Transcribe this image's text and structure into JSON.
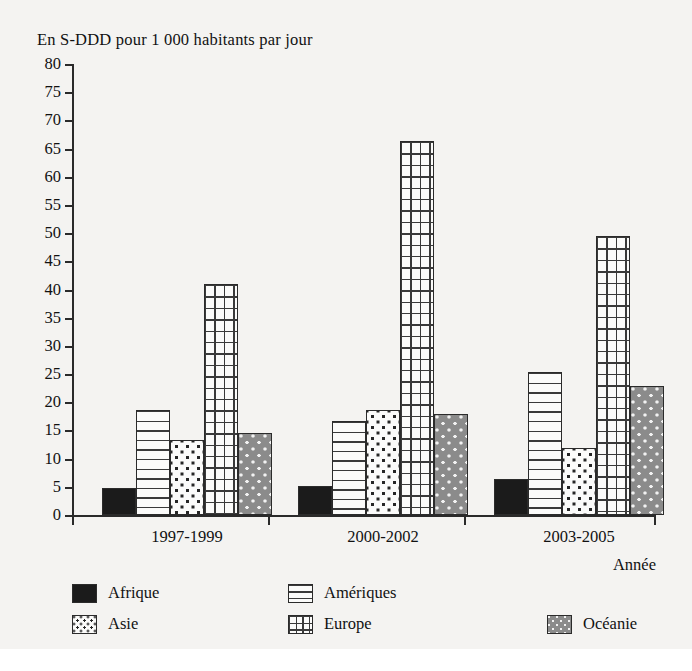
{
  "chart_data": {
    "type": "bar",
    "title": "",
    "ylabel": "En S-DDD pour 1 000 habitants par jour",
    "xlabel": "Année",
    "categories": [
      "1997-1999",
      "2000-2002",
      "2003-2005"
    ],
    "series": [
      {
        "name": "Afrique",
        "values": [
          4.8,
          5.1,
          6.4
        ],
        "pattern": "solid-black",
        "color": "#1b1b1b"
      },
      {
        "name": "Amériques",
        "values": [
          18.7,
          16.6,
          25.4
        ],
        "pattern": "horizontal-lines",
        "color": "#fbfbfa"
      },
      {
        "name": "Asie",
        "values": [
          13.3,
          18.7,
          11.8
        ],
        "pattern": "dots-on-white",
        "color": "#fbfbfa"
      },
      {
        "name": "Europe",
        "values": [
          41.0,
          66.3,
          49.5
        ],
        "pattern": "grid",
        "color": "#fbfbfa"
      },
      {
        "name": "Océanie",
        "values": [
          14.5,
          18.0,
          22.8
        ],
        "pattern": "dots-on-grey",
        "color": "#8b8b8b"
      }
    ],
    "ylim": [
      0,
      80
    ],
    "yticks": [
      0,
      5,
      10,
      15,
      20,
      25,
      30,
      35,
      40,
      45,
      50,
      55,
      60,
      65,
      70,
      75,
      80
    ],
    "ytick_labels": [
      "0",
      "5",
      "10",
      "15",
      "20",
      "25",
      "30",
      "35",
      "40",
      "45",
      "50",
      "55",
      "60",
      "65",
      "70",
      "75",
      "80"
    ],
    "grid": false,
    "legend_position": "bottom"
  },
  "axes": {
    "y_title": "En S-DDD pour 1 000 habitants par jour",
    "x_title": "Année"
  },
  "legend": {
    "items": [
      {
        "label": "Afrique"
      },
      {
        "label": "Amériques"
      },
      {
        "label": "Asie"
      },
      {
        "label": "Europe"
      },
      {
        "label": "Océanie"
      }
    ]
  }
}
